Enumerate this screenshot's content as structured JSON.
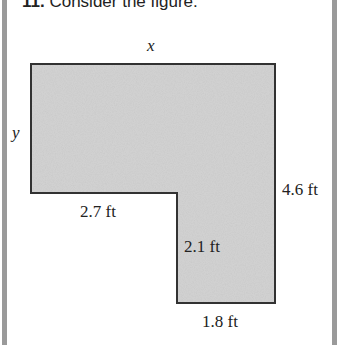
{
  "problem": {
    "number": "11.",
    "prompt": "Consider the figure."
  },
  "figure": {
    "shape": "L-shaped polygon",
    "fill_color": "#d2d2d2",
    "stroke_color": "#333333",
    "labels": {
      "top": "x",
      "left": "y",
      "right": "4.6 ft",
      "notch_horizontal": "2.7 ft",
      "notch_vertical": "2.1 ft",
      "bottom": "1.8 ft"
    }
  }
}
